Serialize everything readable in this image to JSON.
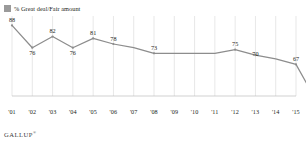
{
  "legend": {
    "swatch_color": "#9a9a9a",
    "label": "% Great deal/Fair amount"
  },
  "footer": {
    "brand": "GALLUP",
    "trademark": "®"
  },
  "chart_data": {
    "type": "line",
    "title": "",
    "subtitle": "",
    "xlabel": "",
    "ylabel": "",
    "grid": "vertical",
    "legend_position": "top-left",
    "line_color": "#8d8d8d",
    "ylim": [
      50,
      92
    ],
    "categories": [
      "'01",
      "'02",
      "'03",
      "'04",
      "'05",
      "'06",
      "'07",
      "'08",
      "'09",
      "'10",
      "'11",
      "'12",
      "'13",
      "'14",
      "'15"
    ],
    "series": [
      {
        "name": "% Great deal/Fair amount",
        "values": [
          88,
          76,
          82,
          76,
          81,
          78,
          76,
          73,
          73,
          73,
          73,
          75,
          72,
          70,
          67
        ],
        "labeled_points": [
          {
            "x": "'01",
            "value": 88,
            "label": "88",
            "position": "above"
          },
          {
            "x": "'02",
            "value": 76,
            "label": "76",
            "position": "below"
          },
          {
            "x": "'03",
            "value": 82,
            "label": "82",
            "position": "above"
          },
          {
            "x": "'04",
            "value": 76,
            "label": "76",
            "position": "below"
          },
          {
            "x": "'05",
            "value": 81,
            "label": "81",
            "position": "above"
          },
          {
            "x": "'06",
            "value": 78,
            "label": "78",
            "position": "above"
          },
          {
            "x": "'08",
            "value": 73,
            "label": "73",
            "position": "above"
          },
          {
            "x": "'12",
            "value": 75,
            "label": "75",
            "position": "above"
          },
          {
            "x": "'13",
            "value": 70,
            "label": "70",
            "position": "above"
          },
          {
            "x": "'15",
            "value": 67,
            "label": "67",
            "position": "above"
          }
        ],
        "endpoint": {
          "value": 55,
          "label": "55",
          "position": "below-right"
        }
      }
    ]
  }
}
